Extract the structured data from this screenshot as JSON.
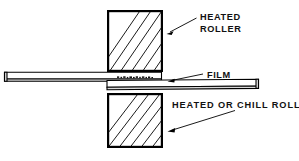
{
  "diagram": {
    "background_color": "#ffffff",
    "line_color": "#000000",
    "labels": {
      "top_roller_line1": "HEATED",
      "top_roller_line2": "ROLLER",
      "film": "FILM",
      "bottom_roller": "HEATED OR CHILL ROLLER"
    },
    "parts": [
      {
        "name": "top-roller",
        "label": "HEATED ROLLER",
        "hatching": "diagonal",
        "x": 107,
        "y": 10,
        "width": 56,
        "height": 62
      },
      {
        "name": "bottom-roller",
        "label": "HEATED OR CHILL ROLLER",
        "hatching": "diagonal",
        "x": 107,
        "y": 93,
        "width": 56,
        "height": 55
      },
      {
        "name": "film-web",
        "label": "FILM",
        "hatching": "none",
        "x": 4,
        "y": 72,
        "width": 255,
        "height": 9
      }
    ],
    "icons": {
      "top_roller_arrow": "arrow-down-left-icon",
      "film_leader": "leader-line-icon",
      "bottom_roller_arrow": "arrow-down-left-icon"
    }
  }
}
